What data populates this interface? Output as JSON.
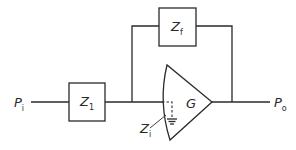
{
  "diagram": {
    "title": "",
    "type": "operational amplifier feedback circuit",
    "nodes": [
      {
        "id": "input",
        "label": "P",
        "subscript": "i"
      },
      {
        "id": "z1",
        "label": "Z",
        "subscript": "1"
      },
      {
        "id": "zf",
        "label": "Z",
        "subscript": "f"
      },
      {
        "id": "amp",
        "label": "G"
      },
      {
        "id": "zi",
        "label": "Z",
        "subscript": "i"
      },
      {
        "id": "output",
        "label": "P",
        "subscript": "o"
      }
    ],
    "edges": [
      {
        "from": "input",
        "to": "z1"
      },
      {
        "from": "z1",
        "to": "amp"
      },
      {
        "from": "z1",
        "to": "zf"
      },
      {
        "from": "zf",
        "to": "output"
      },
      {
        "from": "amp",
        "to": "output"
      }
    ],
    "colors": {
      "ink": "#2a2a2a",
      "background": "#ffffff"
    }
  }
}
